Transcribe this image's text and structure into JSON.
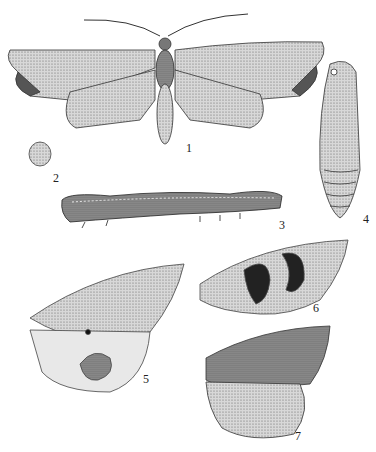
{
  "plate": {
    "background": "#ffffff",
    "ink_color": "#2a2a2a",
    "figures": [
      {
        "id": "1",
        "label": "1",
        "subject": "adult moth, wings spread"
      },
      {
        "id": "2",
        "label": "2",
        "subject": "egg"
      },
      {
        "id": "3",
        "label": "3",
        "subject": "larva (caterpillar)"
      },
      {
        "id": "4",
        "label": "4",
        "subject": "pupa"
      },
      {
        "id": "5",
        "label": "5",
        "subject": "wing variant with hindwing spot"
      },
      {
        "id": "6",
        "label": "6",
        "subject": "forewing variant with dark bands"
      },
      {
        "id": "7",
        "label": "7",
        "subject": "wing variant, dark forewing"
      }
    ]
  }
}
